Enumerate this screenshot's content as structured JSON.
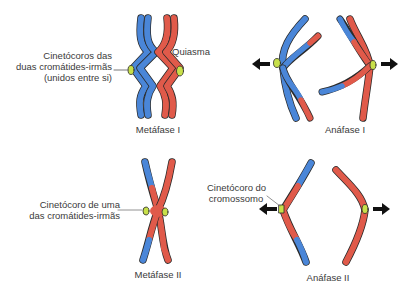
{
  "colors": {
    "blue": "#4a86d8",
    "red": "#e05a4a",
    "kinetochore": "#c8e04a",
    "outline": "#2a2a2a",
    "arrow": "#111111",
    "text": "#3a3a3a"
  },
  "panels": {
    "metafase1": {
      "caption": "Metáfase I",
      "label_kinetochore": [
        "Cinetócoros das",
        "duas cromátides-irmãs",
        "(unidos entre si)"
      ],
      "label_chiasma": "Quiasma"
    },
    "anafase1": {
      "caption": "Anáfase I",
      "arrows": [
        "left",
        "right"
      ]
    },
    "metafase2": {
      "caption": "Metáfase II",
      "label_kinetochore": [
        "Cinetócoro de uma",
        "das cromátides-irmãs"
      ]
    },
    "anafase2": {
      "caption": "Anáfase II",
      "label_kinetochore": [
        "Cinetócoro do",
        "cromossomo"
      ],
      "arrows": [
        "left",
        "right"
      ]
    }
  }
}
